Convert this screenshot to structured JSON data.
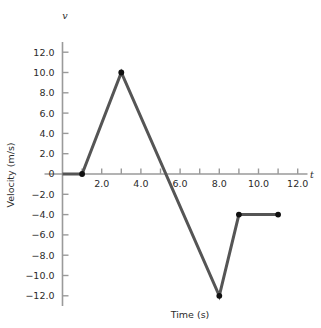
{
  "chart_data": {
    "type": "line",
    "title": "",
    "xlabel": "Time (s)",
    "ylabel": "Velocity (m/s)",
    "x_axis_symbol": "t",
    "y_axis_symbol": "v",
    "xlim": [
      0,
      12.5
    ],
    "ylim": [
      -13.0,
      13.0
    ],
    "grid": false,
    "legend": null,
    "line_color": "#555555",
    "marker_color": "#101010",
    "axis_color": "#9a9a9a",
    "x": [
      0,
      1,
      3,
      8,
      9,
      11
    ],
    "values": [
      0,
      0,
      10,
      -12,
      -4,
      -4
    ],
    "points": [
      {
        "t": 0,
        "v": 0,
        "marker": false
      },
      {
        "t": 1,
        "v": 0,
        "marker": true
      },
      {
        "t": 3,
        "v": 10,
        "marker": true
      },
      {
        "t": 8,
        "v": -12,
        "marker": true
      },
      {
        "t": 9,
        "v": -4,
        "marker": true
      },
      {
        "t": 11,
        "v": -4,
        "marker": true
      }
    ],
    "zero_crossing": 5.3,
    "x_ticks_major": [
      2.0,
      4.0,
      6.0,
      8.0,
      10.0,
      12.0
    ],
    "x_tick_labels": [
      "2.0",
      "4.0",
      "6.0",
      "8.0",
      "10.0",
      "12.0"
    ],
    "x_ticks_minor": [
      1.0,
      3.0,
      5.0,
      7.0,
      9.0,
      11.0
    ],
    "y_ticks": [
      12.0,
      10.0,
      8.0,
      6.0,
      4.0,
      2.0,
      0,
      -2.0,
      -4.0,
      -6.0,
      -8.0,
      -10.0,
      -12.0
    ],
    "y_tick_labels": [
      "12.0",
      "10.0",
      "8.0",
      "6.0",
      "4.0",
      "2.0",
      "0",
      "−2.0",
      "−4.0",
      "−6.0",
      "−8.0",
      "−10.0",
      "−12.0"
    ]
  }
}
